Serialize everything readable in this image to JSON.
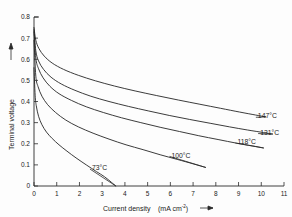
{
  "chart_data": {
    "type": "line",
    "title": "",
    "subtitle": "",
    "xlabel": "Current density",
    "xunit": "(mA cm",
    "xunit_sup": "-2",
    "xunit_tail": ")",
    "ylabel": "Terminal voltage",
    "xlim": [
      0,
      11
    ],
    "ylim": [
      0,
      0.8
    ],
    "xticks": [
      "0",
      "1",
      "2",
      "3",
      "4",
      "5",
      "6",
      "7",
      "8",
      "9",
      "10",
      "11"
    ],
    "xtick_values": [
      0,
      1,
      2,
      3,
      4,
      5,
      6,
      7,
      8,
      9,
      10,
      11
    ],
    "yticks": [
      "0",
      "0.1",
      "0.2",
      "0.3",
      "0.4",
      "0.5",
      "0.6",
      "0.7",
      "0.8"
    ],
    "ytick_values": [
      0,
      0.1,
      0.2,
      0.3,
      0.4,
      0.5,
      0.6,
      0.7,
      0.8
    ],
    "grid": false,
    "legend_position": "in-plot-right",
    "line_color": "#262626",
    "background": "#fdfdfd",
    "series": [
      {
        "name": "73°C",
        "label": "73°C",
        "x": [
          0.0,
          0.05,
          0.1,
          0.2,
          0.35,
          0.55,
          0.8,
          1.1,
          1.45,
          1.85,
          2.3,
          2.75,
          3.1,
          3.4,
          3.6
        ],
        "values": [
          0.56,
          0.43,
          0.38,
          0.33,
          0.29,
          0.255,
          0.225,
          0.195,
          0.165,
          0.133,
          0.1,
          0.068,
          0.044,
          0.018,
          0.0
        ]
      },
      {
        "name": "100°C",
        "label": "100°C",
        "x": [
          0.0,
          0.08,
          0.18,
          0.35,
          0.6,
          0.95,
          1.4,
          1.95,
          2.6,
          3.3,
          4.05,
          4.8,
          5.55,
          6.3,
          7.0,
          7.55
        ],
        "values": [
          0.69,
          0.52,
          0.47,
          0.425,
          0.385,
          0.348,
          0.312,
          0.28,
          0.25,
          0.222,
          0.195,
          0.172,
          0.148,
          0.126,
          0.105,
          0.088
        ]
      },
      {
        "name": "118°C",
        "label": "118°C",
        "x": [
          0.0,
          0.08,
          0.2,
          0.4,
          0.7,
          1.1,
          1.65,
          2.3,
          3.05,
          3.85,
          4.7,
          5.55,
          6.4,
          7.25,
          8.1,
          8.9,
          9.6,
          10.1
        ],
        "values": [
          0.73,
          0.605,
          0.555,
          0.512,
          0.472,
          0.437,
          0.405,
          0.375,
          0.348,
          0.323,
          0.3,
          0.278,
          0.258,
          0.238,
          0.22,
          0.203,
          0.19,
          0.18
        ]
      },
      {
        "name": "131°C",
        "label": "131°C",
        "x": [
          0.0,
          0.08,
          0.2,
          0.42,
          0.75,
          1.2,
          1.8,
          2.5,
          3.3,
          4.15,
          5.05,
          5.95,
          6.85,
          7.75,
          8.6,
          9.4,
          10.1,
          10.5
        ],
        "values": [
          0.74,
          0.64,
          0.592,
          0.552,
          0.515,
          0.483,
          0.453,
          0.425,
          0.4,
          0.377,
          0.355,
          0.334,
          0.315,
          0.297,
          0.28,
          0.265,
          0.253,
          0.246
        ]
      },
      {
        "name": "147°C",
        "label": "147°C",
        "x": [
          0.0,
          0.08,
          0.22,
          0.45,
          0.8,
          1.3,
          1.95,
          2.7,
          3.55,
          4.45,
          5.4,
          6.35,
          7.3,
          8.2,
          9.05,
          9.75,
          10.2
        ],
        "values": [
          0.75,
          0.69,
          0.65,
          0.615,
          0.582,
          0.552,
          0.524,
          0.498,
          0.473,
          0.45,
          0.428,
          0.407,
          0.387,
          0.368,
          0.35,
          0.336,
          0.327
        ]
      }
    ],
    "annotations": [
      {
        "text": "73°C",
        "x": 2.55,
        "y": 0.085
      },
      {
        "text": "100°C",
        "x": 6.05,
        "y": 0.145
      },
      {
        "text": "118°C",
        "x": 8.95,
        "y": 0.208
      },
      {
        "text": "131°C",
        "x": 9.95,
        "y": 0.253
      },
      {
        "text": "147°C",
        "x": 9.85,
        "y": 0.33
      }
    ]
  }
}
